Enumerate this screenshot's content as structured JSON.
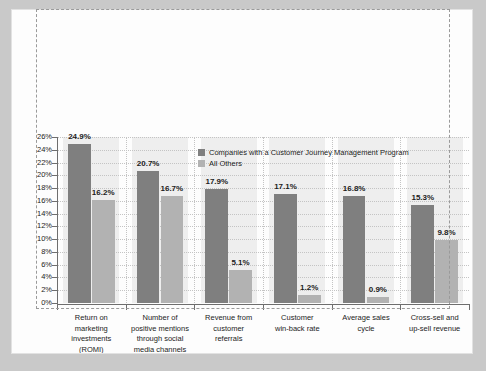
{
  "chart_data": {
    "type": "bar",
    "title": "",
    "xlabel": "",
    "ylabel": "",
    "ylim": [
      0,
      26
    ],
    "ytick_step": 2,
    "grid": true,
    "legend_position": "inside-top-center",
    "categories": [
      "Return on marketing investments (ROMI)",
      "Number of positive mentions through social media channels",
      "Revenue from customer referrals",
      "Customer win-back rate",
      "Average sales cycle",
      "Cross-sell and up-sell revenue"
    ],
    "category_lines": [
      [
        "Return on",
        "marketing",
        "investments",
        "(ROMI)"
      ],
      [
        "Number of",
        "positive mentions",
        "through social",
        "media channels"
      ],
      [
        "Revenue from",
        "customer",
        "referrals"
      ],
      [
        "Customer",
        "win-back rate"
      ],
      [
        "Average sales",
        "cycle"
      ],
      [
        "Cross-sell and",
        "up-sell revenue"
      ]
    ],
    "series": [
      {
        "name": "Companies with a Customer Journey Management Program",
        "color": "#7f7f7f",
        "values": [
          24.9,
          20.7,
          17.9,
          17.1,
          16.8,
          15.3
        ],
        "labels": [
          "24.9%",
          "20.7%",
          "17.9%",
          "17.1%",
          "16.8%",
          "15.3%"
        ]
      },
      {
        "name": "All Others",
        "color": "#b2b2b2",
        "values": [
          16.2,
          16.7,
          5.1,
          1.2,
          0.9,
          9.8
        ],
        "labels": [
          "16.2%",
          "16.7%",
          "5.1%",
          "1.2%",
          "0.9%",
          "9.8%"
        ]
      }
    ],
    "ytick_labels": [
      "26%",
      "24%",
      "22%",
      "20%",
      "18%",
      "16%",
      "14%",
      "12%",
      "10%",
      "8%",
      "6%",
      "4%",
      "2%",
      "0%"
    ],
    "ytick_values": [
      26,
      24,
      22,
      20,
      18,
      16,
      14,
      12,
      10,
      8,
      6,
      4,
      2,
      0
    ]
  },
  "legend": {
    "items": [
      {
        "label": "Companies with a Customer Journey Management Program",
        "color": "#7f7f7f"
      },
      {
        "label": "All Others",
        "color": "#b2b2b2"
      }
    ]
  },
  "colors": {
    "series_primary": "#7f7f7f",
    "series_secondary": "#b2b2b2",
    "axis": "#6e6e6e",
    "grid": "#c4c4c4",
    "band": "#eeeeee",
    "page": "#fdfdfd",
    "frame": "#c9c9c9",
    "marquee": "#9a9a9a"
  }
}
